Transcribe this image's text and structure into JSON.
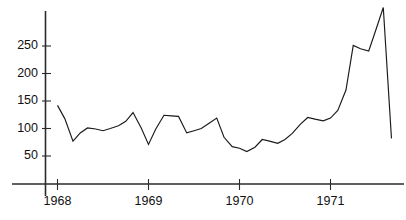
{
  "chart_data": {
    "type": "line",
    "title": "",
    "subtitle": "",
    "xlabel": "",
    "ylabel": "",
    "grid": false,
    "legend": false,
    "legend_position": "none",
    "line_color": "#1a1a1a",
    "axis_color": "#2b2b2b",
    "background_color": "#ffffff",
    "x_tick_labels": [
      "1968",
      "1969",
      "1970",
      "1971"
    ],
    "x_tick_values": [
      1968,
      1969,
      1970,
      1971
    ],
    "y_tick_labels": [
      "50",
      "100",
      "150",
      "200",
      "250"
    ],
    "y_tick_values": [
      50,
      100,
      150,
      200,
      250
    ],
    "ylim": [
      0,
      330
    ],
    "xlim": [
      1967.85,
      1971.78
    ],
    "x": [
      1968.0,
      1968.08,
      1968.17,
      1968.25,
      1968.33,
      1968.42,
      1968.5,
      1968.58,
      1968.67,
      1968.75,
      1968.83,
      1968.92,
      1969.0,
      1969.08,
      1969.17,
      1969.25,
      1969.33,
      1969.42,
      1969.5,
      1969.58,
      1969.67,
      1969.75,
      1969.83,
      1969.92,
      1970.0,
      1970.08,
      1970.17,
      1970.25,
      1970.33,
      1970.42,
      1970.5,
      1970.58,
      1970.67,
      1970.75,
      1970.83,
      1970.92,
      1971.0,
      1971.08,
      1971.17,
      1971.25,
      1971.33,
      1971.42,
      1971.5,
      1971.58,
      1971.67
    ],
    "values": [
      142,
      118,
      77,
      92,
      101,
      99,
      96,
      100,
      105,
      113,
      129,
      101,
      71,
      99,
      124,
      123,
      122,
      92,
      96,
      100,
      110,
      119,
      84,
      67,
      64,
      58,
      66,
      80,
      77,
      73,
      80,
      91,
      108,
      120,
      117,
      114,
      119,
      133,
      170,
      251,
      245,
      241,
      280,
      320,
      82
    ],
    "annotations": []
  },
  "axes": {
    "y_axis_name": "y-axis",
    "x_axis_name": "x-axis"
  }
}
